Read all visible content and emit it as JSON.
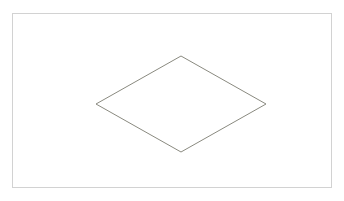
{
  "canvas": {
    "width": 344,
    "height": 201,
    "background_color": "#ffffff",
    "frame": {
      "name": "drawing-frame",
      "x": 12,
      "y": 13,
      "width": 320,
      "height": 175,
      "stroke_color": "#d2d2d2",
      "stroke_width": 1,
      "fill_color": "#ffffff"
    }
  },
  "shapes": [
    {
      "id": "rhombus-1",
      "type": "rhombus",
      "label": "",
      "stroke_color": "#8a8a80",
      "stroke_width": 1,
      "fill_color": "none",
      "points": "181,56 266,104 181,152 96,104",
      "vertices": {
        "top": {
          "x": 181,
          "y": 56
        },
        "right": {
          "x": 266,
          "y": 104
        },
        "bottom": {
          "x": 181,
          "y": 152
        },
        "left": {
          "x": 96,
          "y": 104
        }
      },
      "center": {
        "x": 181,
        "y": 104
      },
      "diagonal_horizontal": 170,
      "diagonal_vertical": 96
    }
  ]
}
